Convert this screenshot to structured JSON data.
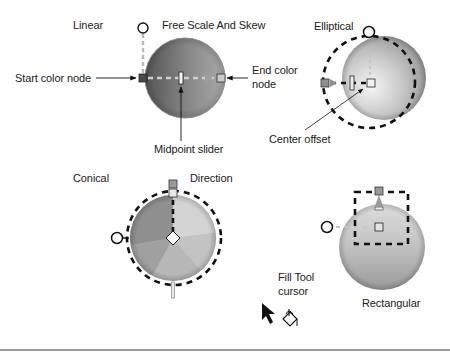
{
  "figure": {
    "type": "gradient-fill-handles-diagram",
    "panels": [
      {
        "id": "linear",
        "title": "Linear",
        "secondary_title": "Free Scale And Skew",
        "callouts": {
          "start_node": "Start color node",
          "end_node_line1": "End color",
          "end_node_line2": "node",
          "midpoint": "Midpoint slider"
        }
      },
      {
        "id": "elliptical",
        "title": "Elliptical",
        "callouts": {
          "center": "Center offset"
        }
      },
      {
        "id": "conical",
        "title": "Conical",
        "secondary_title": "Direction"
      },
      {
        "id": "rectangular",
        "title": "Rectangular"
      }
    ],
    "cursor": {
      "label_line1": "Fill Tool",
      "label_line2": "cursor",
      "icon": "fill-bucket-cursor-icon"
    }
  },
  "colors": {
    "background": "#ffffff",
    "sphere_dark": "#6f6f6f",
    "sphere_light": "#d9d9d9",
    "handle_stroke": "#111111",
    "dashed_path": "#111111",
    "gradient_axis": "#bdbdbd",
    "rule": "#9a9a9a",
    "text": "#222222"
  }
}
